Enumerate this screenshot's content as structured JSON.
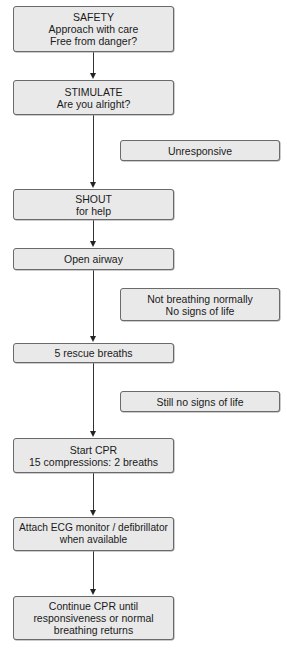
{
  "diagram": {
    "type": "flowchart",
    "steps": [
      {
        "id": "safety",
        "lines": [
          "SAFETY",
          "Approach with care",
          "Free from danger?"
        ]
      },
      {
        "id": "stimulate",
        "lines": [
          "STIMULATE",
          "Are you alright?"
        ]
      },
      {
        "id": "shout",
        "lines": [
          "SHOUT",
          "for help"
        ]
      },
      {
        "id": "open-airway",
        "lines": [
          "Open airway"
        ]
      },
      {
        "id": "rescue-breaths",
        "lines": [
          "5 rescue breaths"
        ]
      },
      {
        "id": "start-cpr",
        "lines": [
          "Start CPR",
          "15 compressions: 2 breaths"
        ]
      },
      {
        "id": "attach-ecg",
        "lines": [
          "Attach ECG monitor / defibrillator",
          "when available"
        ]
      },
      {
        "id": "continue-cpr",
        "lines": [
          "Continue CPR until",
          "responsiveness or normal",
          "breathing returns"
        ]
      }
    ],
    "conditions": [
      {
        "id": "unresponsive",
        "lines": [
          "Unresponsive"
        ]
      },
      {
        "id": "not-breathing",
        "lines": [
          "Not breathing normally",
          "No signs of life"
        ]
      },
      {
        "id": "still-no-signs",
        "lines": [
          "Still no signs of life"
        ]
      }
    ],
    "colors": {
      "box_fill": "#e9e9e9",
      "box_border": "#6a6a6a",
      "connector": "#333333"
    }
  }
}
